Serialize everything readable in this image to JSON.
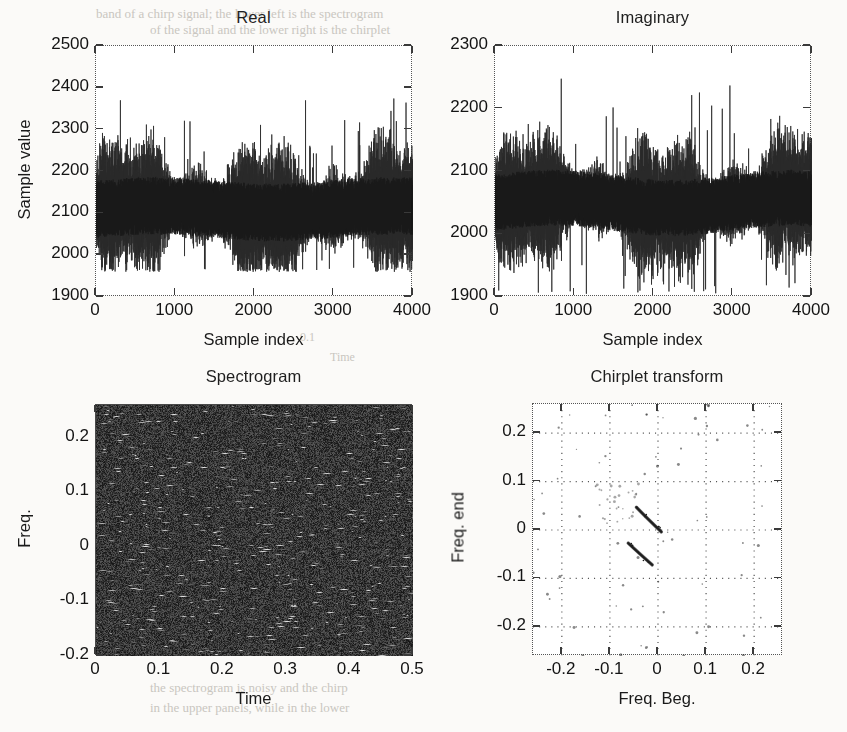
{
  "figure": {
    "title": "",
    "layout": "2x2 subplot grid",
    "background_color": "#fbfaf8",
    "ink_color": "#1a1a1a"
  },
  "bleed_text": [
    {
      "text": "band of a chirp signal; the lower left is the spectrogram",
      "x": 96,
      "y": 6,
      "size": 13
    },
    {
      "text": "of the signal and the lower right is the chirplet",
      "x": 150,
      "y": 22,
      "size": 13
    },
    {
      "text": "the spectrogram is noisy and the chirp",
      "x": 150,
      "y": 680,
      "size": 13
    },
    {
      "text": "in the upper panels, while in the lower",
      "x": 150,
      "y": 700,
      "size": 13
    },
    {
      "text": "0.1",
      "x": 300,
      "y": 330,
      "size": 12
    },
    {
      "text": "Time",
      "x": 330,
      "y": 350,
      "size": 12
    }
  ],
  "panels": [
    {
      "id": "real",
      "name": "real-panel",
      "title": "Real",
      "type": "line",
      "xlabel": "Sample index",
      "ylabel": "Sample value",
      "xticks": [
        "0",
        "1000",
        "2000",
        "3000",
        "4000"
      ],
      "xtick_values": [
        0,
        1000,
        2000,
        3000,
        4000
      ],
      "yticks": [
        "1900",
        "2000",
        "2100",
        "2200",
        "2300",
        "2400",
        "2500"
      ],
      "ytick_values": [
        1900,
        2000,
        2100,
        2200,
        2300,
        2400,
        2500
      ],
      "xlim": [
        0,
        4000
      ],
      "ylim": [
        1900,
        2500
      ],
      "grid": false,
      "series_description": "Noisy oscillatory real part of a complex signal, mean approximately 2110, typical envelope 2000 to 2300, occasional excursions to 2380",
      "mean": 2110,
      "envelope_low": 2000,
      "envelope_high": 2300,
      "peak_high": 2390,
      "peak_low": 1960,
      "n_samples": 4000,
      "trace_color": "#2a2a2a"
    },
    {
      "id": "imaginary",
      "name": "imaginary-panel",
      "title": "Imaginary",
      "type": "line",
      "xlabel": "Sample index",
      "ylabel": "",
      "xticks": [
        "0",
        "1000",
        "2000",
        "3000",
        "4000"
      ],
      "xtick_values": [
        0,
        1000,
        2000,
        3000,
        4000
      ],
      "yticks": [
        "1900",
        "2000",
        "2100",
        "2200",
        "2300"
      ],
      "ytick_values": [
        1900,
        2000,
        2100,
        2200,
        2300
      ],
      "xlim": [
        0,
        4000
      ],
      "ylim": [
        1900,
        2300
      ],
      "grid": false,
      "series_description": "Noisy oscillatory imaginary part of a complex signal, mean approximately 2050, typical envelope 1960 to 2150, occasional excursions to 2270",
      "mean": 2050,
      "envelope_low": 1955,
      "envelope_high": 2150,
      "peak_high": 2275,
      "peak_low": 1905,
      "n_samples": 4000,
      "trace_color": "#2a2a2a"
    },
    {
      "id": "spectrogram",
      "name": "spectrogram-panel",
      "title": "Spectrogram",
      "type": "heatmap",
      "xlabel": "Time",
      "ylabel": "Freq.",
      "xticks": [
        "0",
        "0.1",
        "0.2",
        "0.3",
        "0.4",
        "0.5"
      ],
      "xtick_values": [
        0,
        0.1,
        0.2,
        0.3,
        0.4,
        0.5
      ],
      "yticks": [
        "-0.2",
        "-0.1",
        "0",
        "0.1",
        "0.2"
      ],
      "ytick_values": [
        -0.2,
        -0.1,
        0,
        0.1,
        0.2
      ],
      "xlim": [
        0,
        0.5
      ],
      "ylim": [
        -0.2,
        0.26
      ],
      "grid": false,
      "colormap": "gray",
      "description": "Dense dark noise field with short bright horizontal streaks; the chirp is not visible above the noise",
      "background_level": 0.22,
      "streak_level": 0.75
    },
    {
      "id": "chirplet",
      "name": "chirplet-panel",
      "title": "Chirplet transform",
      "type": "scatter",
      "xlabel": "Freq. Beg.",
      "ylabel": "Freq. end",
      "xticks": [
        "-0.2",
        "-0.1",
        "0",
        "0.1",
        "0.2"
      ],
      "xtick_values": [
        -0.2,
        -0.1,
        0,
        0.1,
        0.2
      ],
      "yticks": [
        "-0.2",
        "-0.1",
        "0",
        "0.1",
        "0.2"
      ],
      "ytick_values": [
        -0.2,
        -0.1,
        0,
        0.1,
        0.2
      ],
      "xlim": [
        -0.26,
        0.26
      ],
      "ylim": [
        -0.26,
        0.26
      ],
      "grid": true,
      "grid_style": "dotted",
      "description": "Mostly empty plane with sparse scattered dots and two prominent dark diagonal detections descending to the right",
      "detections": [
        {
          "x_start": -0.045,
          "y_start": 0.047,
          "x_end": 0.007,
          "y_end": -0.004,
          "label": "chirp detection 1"
        },
        {
          "x_start": -0.062,
          "y_start": -0.027,
          "x_end": -0.012,
          "y_end": -0.072,
          "label": "chirp detection 2"
        }
      ],
      "marker_color": "#1a1a1a"
    }
  ]
}
